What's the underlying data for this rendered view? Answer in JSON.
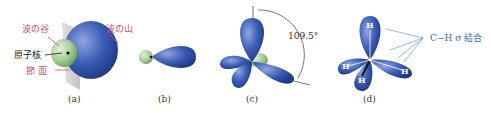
{
  "panels": {
    "a": {
      "caption": "(a)",
      "labels": {
        "valley": "波の谷",
        "crest": "波の山",
        "nucleus": "原子核",
        "node_plane": "節 面"
      }
    },
    "b": {
      "caption": "(b)"
    },
    "c": {
      "caption": "(c)",
      "angle_label": "109.5°"
    },
    "d": {
      "caption": "(d)",
      "bond_label": "C−H σ 結合",
      "atoms": [
        "H",
        "H",
        "H",
        "H"
      ],
      "center_atom": "C"
    }
  },
  "colors": {
    "lobe_blue": "#3a5fb0",
    "lobe_green": "#9bc48e",
    "label_pink": "#d4507a",
    "label_blue": "#2f6fb5"
  }
}
